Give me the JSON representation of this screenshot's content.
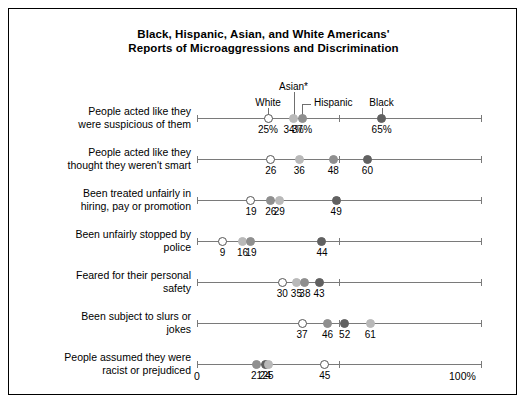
{
  "chart_title_line1": "Black, Hispanic, Asian, and White Americans'",
  "chart_title_line2": "Reports of Microaggressions and Discrimination",
  "legend": {
    "white": "White",
    "asian": "Asian*",
    "hispanic": "Hispanic",
    "black": "Black"
  },
  "axis": {
    "start_label": "0",
    "end_label": "100%",
    "min": 0,
    "max": 100
  },
  "chart_data": {
    "type": "scatter",
    "title": "Black, Hispanic, Asian, and White Americans' Reports of Microaggressions and Discrimination",
    "xlabel": "",
    "ylabel": "",
    "xlim": [
      0,
      100
    ],
    "grid": false,
    "legend_position": "top",
    "orientation": "horizontal-dot-plot",
    "series_names": [
      "White",
      "Asian*",
      "Hispanic",
      "Black"
    ],
    "series_colors": {
      "White": "#ffffff",
      "Asian*": "#b9b9b9",
      "Hispanic": "#8f8f8f",
      "Black": "#616161"
    },
    "categories": [
      "People acted like they were suspicious of them",
      "People acted like they thought they weren't smart",
      "Been treated unfairly in hiring, pay or promotion",
      "Been unfairly stopped by police",
      "Feared for their personal safety",
      "Been subject to slurs or jokes",
      "People assumed they were racist or prejudiced"
    ],
    "rows": [
      {
        "label_line1": "People acted like they",
        "label_line2": "were suspicious of them",
        "points": [
          {
            "series": "White",
            "value": 25,
            "label": "25%"
          },
          {
            "series": "Asian*",
            "value": 34,
            "label": "34%"
          },
          {
            "series": "Hispanic",
            "value": 37,
            "label": "37%"
          },
          {
            "series": "Black",
            "value": 65,
            "label": "65%"
          }
        ]
      },
      {
        "label_line1": "People acted like they",
        "label_line2": "thought they weren't smart",
        "points": [
          {
            "series": "White",
            "value": 26,
            "label": "26"
          },
          {
            "series": "Asian*",
            "value": 36,
            "label": "36"
          },
          {
            "series": "Hispanic",
            "value": 48,
            "label": "48"
          },
          {
            "series": "Black",
            "value": 60,
            "label": "60"
          }
        ]
      },
      {
        "label_line1": "Been treated unfairly in",
        "label_line2": "hiring, pay or promotion",
        "points": [
          {
            "series": "White",
            "value": 19,
            "label": "19"
          },
          {
            "series": "Hispanic",
            "value": 26,
            "label": "26"
          },
          {
            "series": "Asian*",
            "value": 29,
            "label": "29"
          },
          {
            "series": "Black",
            "value": 49,
            "label": "49"
          }
        ]
      },
      {
        "label_line1": "Been unfairly stopped by",
        "label_line2": "police",
        "points": [
          {
            "series": "White",
            "value": 9,
            "label": "9"
          },
          {
            "series": "Asian*",
            "value": 16,
            "label": "16"
          },
          {
            "series": "Hispanic",
            "value": 19,
            "label": "19"
          },
          {
            "series": "Black",
            "value": 44,
            "label": "44"
          }
        ]
      },
      {
        "label_line1": "Feared for their personal",
        "label_line2": "safety",
        "points": [
          {
            "series": "White",
            "value": 30,
            "label": "30"
          },
          {
            "series": "Asian*",
            "value": 35,
            "label": "35"
          },
          {
            "series": "Hispanic",
            "value": 38,
            "label": "38"
          },
          {
            "series": "Black",
            "value": 43,
            "label": "43"
          }
        ]
      },
      {
        "label_line1": "Been subject to slurs or",
        "label_line2": "jokes",
        "points": [
          {
            "series": "White",
            "value": 37,
            "label": "37"
          },
          {
            "series": "Hispanic",
            "value": 46,
            "label": "46"
          },
          {
            "series": "Black",
            "value": 52,
            "label": "52"
          },
          {
            "series": "Asian*",
            "value": 61,
            "label": "61"
          }
        ]
      },
      {
        "label_line1": "People assumed they were",
        "label_line2": "racist or prejudiced",
        "points": [
          {
            "series": "Hispanic",
            "value": 21,
            "label": "21"
          },
          {
            "series": "Black",
            "value": 24,
            "label": "24"
          },
          {
            "series": "Asian*",
            "value": 25,
            "label": "25"
          },
          {
            "series": "White",
            "value": 45,
            "label": "45"
          }
        ]
      }
    ]
  }
}
